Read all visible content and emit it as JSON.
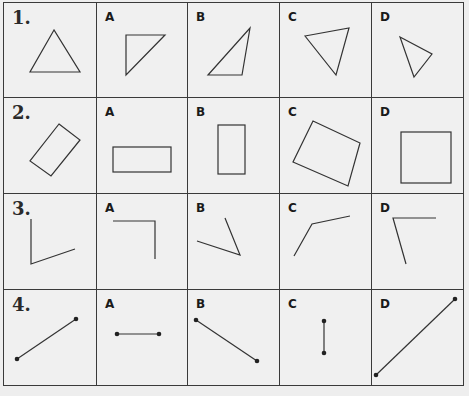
{
  "worksheet": {
    "rows": [
      {
        "number": "1.",
        "prompt_shape": "equilateral-triangle",
        "options": [
          {
            "label": "A",
            "shape": "right-triangle"
          },
          {
            "label": "B",
            "shape": "obtuse-triangle"
          },
          {
            "label": "C",
            "shape": "inverted-triangle"
          },
          {
            "label": "D",
            "shape": "small-rotated-triangle"
          }
        ]
      },
      {
        "number": "2.",
        "prompt_shape": "rotated-rectangle",
        "options": [
          {
            "label": "A",
            "shape": "horizontal-rectangle"
          },
          {
            "label": "B",
            "shape": "vertical-rectangle"
          },
          {
            "label": "C",
            "shape": "tilted-rectangle"
          },
          {
            "label": "D",
            "shape": "square"
          }
        ]
      },
      {
        "number": "3.",
        "prompt_shape": "acute-angle",
        "options": [
          {
            "label": "A",
            "shape": "right-angle"
          },
          {
            "label": "B",
            "shape": "acute-angle-rotated"
          },
          {
            "label": "C",
            "shape": "obtuse-angle"
          },
          {
            "label": "D",
            "shape": "acute-angle-open"
          }
        ]
      },
      {
        "number": "4.",
        "prompt_shape": "line-segment-diagonal",
        "options": [
          {
            "label": "A",
            "shape": "short-horizontal-segment"
          },
          {
            "label": "B",
            "shape": "descending-segment"
          },
          {
            "label": "C",
            "shape": "short-vertical-segment"
          },
          {
            "label": "D",
            "shape": "long-diagonal-segment"
          }
        ]
      }
    ]
  }
}
